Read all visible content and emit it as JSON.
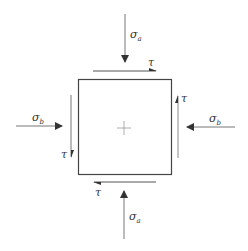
{
  "diagram": {
    "title": "",
    "colors": {
      "line": "#444444",
      "light_line": "#888888",
      "text": "#333333",
      "background": "#ffffff"
    },
    "labels": {
      "sigma_a_top": {
        "symbol": "σ",
        "sub": "a"
      },
      "sigma_a_bottom": {
        "symbol": "σ",
        "sub": "a"
      },
      "sigma_b_left": {
        "symbol": "σ",
        "sub": "b"
      },
      "sigma_b_right": {
        "symbol": "σ",
        "sub": "b"
      },
      "tau_top": "τ",
      "tau_right": "τ",
      "tau_bottom": "τ",
      "tau_left": "τ"
    },
    "element": {
      "shape": "square",
      "center_mark": "cross"
    }
  }
}
